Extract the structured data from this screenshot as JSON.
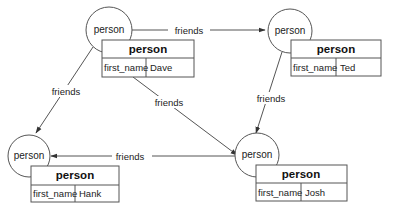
{
  "diagram": {
    "type": "graph",
    "colors": {
      "stroke": "#555555",
      "background": "#ffffff",
      "text": "#222222"
    },
    "nodes": [
      {
        "id": "dave",
        "label": "person",
        "table": {
          "title": "person",
          "key": "first_name",
          "value": "Dave"
        }
      },
      {
        "id": "ted",
        "label": "person",
        "table": {
          "title": "person",
          "key": "first_name",
          "value": "Ted"
        }
      },
      {
        "id": "hank",
        "label": "person",
        "table": {
          "title": "person",
          "key": "first_name",
          "value": "Hank"
        }
      },
      {
        "id": "josh",
        "label": "person",
        "table": {
          "title": "person",
          "key": "first_name",
          "value": "Josh"
        }
      }
    ],
    "edges": [
      {
        "from": "dave",
        "to": "ted",
        "label": "friends"
      },
      {
        "from": "dave",
        "to": "hank",
        "label": "friends"
      },
      {
        "from": "dave",
        "to": "josh",
        "label": "friends"
      },
      {
        "from": "ted",
        "to": "josh",
        "label": "friends"
      },
      {
        "from": "josh",
        "to": "hank",
        "label": "friends"
      }
    ]
  }
}
